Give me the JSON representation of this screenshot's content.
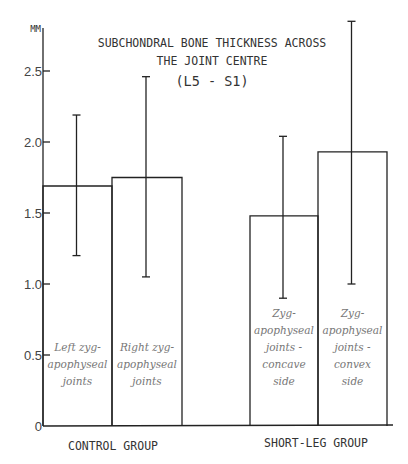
{
  "chart_data": {
    "type": "bar",
    "title_lines": [
      "SUBCHONDRAL BONE THICKNESS ACROSS",
      "THE JOINT CENTRE",
      "(L5 - S1)"
    ],
    "ylabel": "MM",
    "xlabel": "",
    "ylim": [
      0,
      2.9
    ],
    "yticks": [
      "0",
      "0.5",
      "1.0",
      "1.5",
      "2.0",
      "2.5"
    ],
    "grid": false,
    "groups": [
      "CONTROL GROUP",
      "SHORT-LEG GROUP"
    ],
    "categories": [
      "Left zygapophyseal joints",
      "Right zygapophyseal joints",
      "Zygapophyseal joints - concave side",
      "Zygapophyseal joints - convex side"
    ],
    "category_label_lines": [
      [
        "Left zyg-",
        "apophyseal",
        "joints"
      ],
      [
        "Right zyg-",
        "apophyseal",
        "joints"
      ],
      [
        "Zyg-",
        "apophyseal",
        "joints -",
        "concave",
        "side"
      ],
      [
        "Zyg-",
        "apophyseal",
        "joints -",
        "convex",
        "side"
      ]
    ],
    "values": [
      1.69,
      1.75,
      1.48,
      1.93
    ],
    "error_low": [
      1.2,
      1.05,
      0.9,
      1.0
    ],
    "error_high": [
      2.19,
      2.46,
      2.04,
      2.85
    ]
  }
}
